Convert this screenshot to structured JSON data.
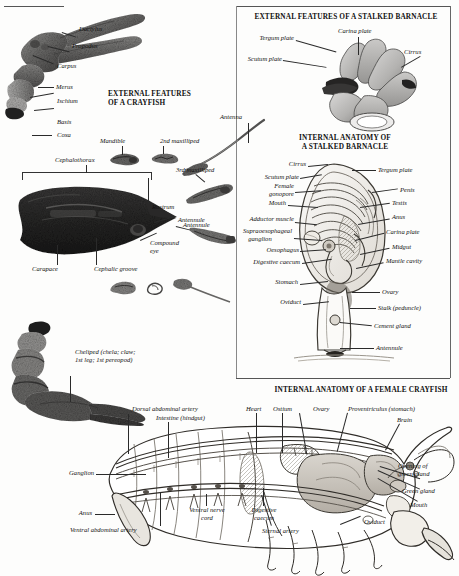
{
  "plate": {
    "title": "Crustacean anatomy plate",
    "background": "#fdfdfc",
    "ink": "#111111"
  },
  "sections": [
    {
      "id": "external-crayfish",
      "heading": "EXTERNAL FEATURES\nOF A CRAYFISH",
      "heading_line1": "EXTERNAL FEATURES",
      "heading_line2": "OF A CRAYFISH"
    },
    {
      "id": "external-barnacle",
      "heading": "EXTERNAL FEATURES OF A STALKED BARNACLE"
    },
    {
      "id": "internal-barnacle",
      "heading_line1": "INTERNAL ANATOMY OF",
      "heading_line2": "A STALKED BARNACLE"
    },
    {
      "id": "internal-crayfish",
      "heading": "INTERNAL ANATOMY OF A FEMALE CRAYFISH"
    }
  ],
  "cheliped_labels": {
    "dactylus": "Dactylus",
    "propodus": "Propodus",
    "carpus": "Carpus",
    "merus": "Merus",
    "ischium": "Ischium",
    "basis": "Basis",
    "coxa": "Coxa"
  },
  "appendage_labels": {
    "mandible": "Mandible",
    "second_maxilliped": "2nd maxilliped",
    "third_maxilliped": "3rd maxilliped",
    "antenna": "Antenna",
    "antennule": "Antennule"
  },
  "cephalothorax_labels": {
    "cephalothorax": "Cephalothorax",
    "rostrum": "Rostrum",
    "compound_eye_line1": "Compound",
    "compound_eye_line2": "eye",
    "carapace": "Carapace",
    "cephalic_groove": "Cephalic groove"
  },
  "cheliped_caption": {
    "line1": "Cheliped (chela; claw;",
    "line2": "1st leg; 1st pereopod)"
  },
  "barnacle_external_labels": {
    "tergum_plate": "Tergum plate",
    "carina_plate": "Carina plate",
    "scutum_plate": "Scutum plate",
    "cirrus": "Cirrus"
  },
  "barnacle_internal_left_labels": [
    "Cirrus",
    "Scutum plate",
    "Female\ngonopore",
    "Mouth",
    "Adductor muscle",
    "Supraoesophageal\nganglion",
    "Oesophagus",
    "Digestive caecum",
    "Stomach",
    "Oviduct"
  ],
  "barnacle_internal_left": {
    "cirrus": "Cirrus",
    "scutum_plate": "Scutum plate",
    "female_gonopore_l1": "Female",
    "female_gonopore_l2": "gonopore",
    "mouth": "Mouth",
    "adductor_muscle": "Adductor muscle",
    "supraoesophageal_l1": "Supraoesophageal",
    "supraoesophageal_l2": "ganglion",
    "oesophagus": "Oesophagus",
    "digestive_caecum": "Digestive caecum",
    "stomach": "Stomach",
    "oviduct": "Oviduct"
  },
  "barnacle_internal_right": {
    "tergum_plate": "Tergum plate",
    "penis": "Penis",
    "testis": "Testis",
    "anus": "Anus",
    "carina_plate": "Carina plate",
    "midgut": "Midgut",
    "mantle_cavity": "Mantle cavity",
    "ovary": "Ovary",
    "stalk": "Stalk (peduncle)",
    "cement_gland": "Cement gland",
    "antennule": "Antennule"
  },
  "crayfish_internal_labels": {
    "dorsal_abdominal_artery": "Dorsal abdominal artery",
    "intestine": "Intestine (hindgut)",
    "heart": "Heart",
    "ostium": "Ostium",
    "ovary": "Ovary",
    "proventriculus": "Proventriculus (stomach)",
    "brain": "Brain",
    "ganglion": "Ganglion",
    "anus": "Anus",
    "ventral_abdominal_artery": "Ventral abdominal artery",
    "ventral_nerve_cord_l1": "Ventral nerve",
    "ventral_nerve_cord_l2": "cord",
    "digestive_caecum_l1": "Digestive",
    "digestive_caecum_l2": "caecum",
    "sternal_artery": "Sternal artery",
    "opening_green_gland_l1": "Opening of",
    "opening_green_gland_l2": "green gland",
    "green_gland": "Green gland",
    "mouth": "Mouth",
    "oviduct": "Oviduct"
  }
}
